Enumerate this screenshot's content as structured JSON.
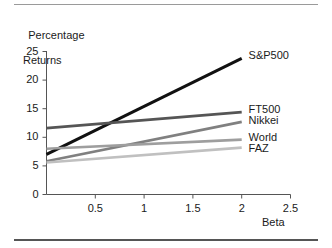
{
  "figure": {
    "name": "beta-vs-percentage-returns-line-chart",
    "background_color": "#ffffff",
    "top_rule_color": "#9a9a9a",
    "bottom_rule_color": "#555555",
    "axis_color": "#555555"
  },
  "chart_data": {
    "type": "line",
    "title": "",
    "ylabel_line1": "Percentage",
    "ylabel_line2": "Returns",
    "xlabel": "Beta",
    "xlim": [
      0,
      2.5
    ],
    "ylim": [
      0,
      25
    ],
    "xticks": [
      0.5,
      1,
      1.5,
      2,
      2.5
    ],
    "xtick_labels": [
      "0.5",
      "1",
      "1.5",
      "2",
      "2.5"
    ],
    "yticks": [
      0,
      5,
      10,
      15,
      20,
      25
    ],
    "ytick_labels": [
      "0",
      "5",
      "10",
      "15",
      "20",
      "25"
    ],
    "grid": false,
    "legend_position": "right-of-line-ends",
    "x": [
      0,
      2
    ],
    "series": [
      {
        "name": "S&P500",
        "values": [
          7,
          23.8
        ],
        "color": "#111111",
        "width": 3.0,
        "label_x": 2.05,
        "label_y": 24.2
      },
      {
        "name": "FT500",
        "values": [
          11.6,
          14.4
        ],
        "color": "#555555",
        "width": 2.6,
        "label_x": 2.05,
        "label_y": 14.7
      },
      {
        "name": "Nikkei",
        "values": [
          5.8,
          12.7
        ],
        "color": "#808080",
        "width": 2.6,
        "label_x": 2.05,
        "label_y": 12.9
      },
      {
        "name": "World",
        "values": [
          8.0,
          9.6
        ],
        "color": "#9e9e9e",
        "width": 2.6,
        "label_x": 2.05,
        "label_y": 9.9
      },
      {
        "name": "FAZ",
        "values": [
          5.6,
          8.2
        ],
        "color": "#c0c0c0",
        "width": 2.6,
        "label_x": 2.05,
        "label_y": 7.9
      }
    ]
  }
}
